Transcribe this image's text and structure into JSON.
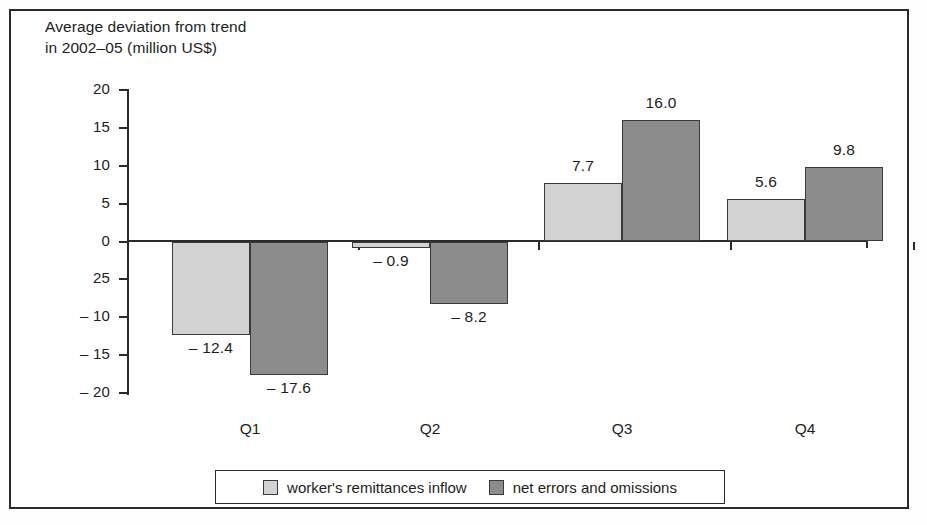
{
  "chart_data": {
    "type": "bar",
    "title": "Average deviation from trend\nin 2002–05 (million US$)",
    "xlabel": "",
    "ylabel": "",
    "categories": [
      "Q1",
      "Q2",
      "Q3",
      "Q4"
    ],
    "series": [
      {
        "name": "worker's remittances inflow",
        "color": "#d2d2d2",
        "values": [
          -12.4,
          -0.9,
          7.7,
          5.6
        ],
        "value_labels": [
          "– 12.4",
          "– 0.9",
          "7.7",
          "5.6"
        ]
      },
      {
        "name": "net errors and omissions",
        "color": "#8c8c8c",
        "values": [
          -17.6,
          -8.2,
          16.0,
          9.8
        ],
        "value_labels": [
          "– 17.6",
          "– 8.2",
          "16.0",
          "9.8"
        ]
      }
    ],
    "ylim": [
      -20,
      20
    ],
    "y_ticks": [
      20,
      15,
      10,
      5,
      0,
      -5,
      -10,
      -15,
      -20
    ],
    "y_tick_labels": [
      "20",
      "15",
      "10",
      "5",
      "0",
      "25",
      "– 10",
      "– 15",
      "– 20"
    ],
    "grid": false,
    "legend_position": "bottom"
  },
  "legend": {
    "items": [
      {
        "label": "worker's remittances inflow"
      },
      {
        "label": "net errors and omissions"
      }
    ]
  }
}
